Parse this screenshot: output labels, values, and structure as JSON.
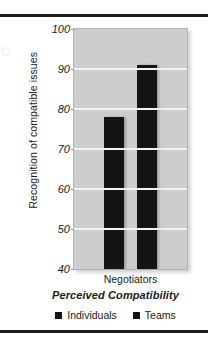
{
  "chart_data": {
    "type": "bar",
    "title": "",
    "subtitle": "",
    "xlabel": "Perceived Compatibility",
    "ylabel": "Recognition of compatible issues",
    "categories": [
      "Negotiators"
    ],
    "series": [
      {
        "name": "Individuals",
        "values": [
          78
        ],
        "color": "#141414"
      },
      {
        "name": "Teams",
        "values": [
          91
        ],
        "color": "#141414"
      }
    ],
    "ylim": [
      40,
      100
    ],
    "ytick_labels": [
      "100",
      "90",
      "80",
      "70",
      "60",
      "50",
      "40"
    ],
    "ytick_values": [
      100,
      90,
      80,
      70,
      60,
      50,
      40
    ],
    "ytick_step": 10,
    "grid": true,
    "grid_axis": "y",
    "legend_position": "bottom",
    "legend_entries": [
      "Individuals",
      "Teams"
    ],
    "plot_background": "#cdcdcd",
    "gridline_color": "#f2f2f2",
    "annotations": []
  },
  "figure": {
    "ylabel": "Recognition of compatible issues",
    "category_label": "Negotiators",
    "axis_title": "Perceived Compatibility"
  },
  "legend": {
    "items": [
      {
        "label": "Individuals",
        "swatch": "legend-swatch-individuals"
      },
      {
        "label": "Teams",
        "swatch": "legend-swatch-teams"
      }
    ]
  }
}
